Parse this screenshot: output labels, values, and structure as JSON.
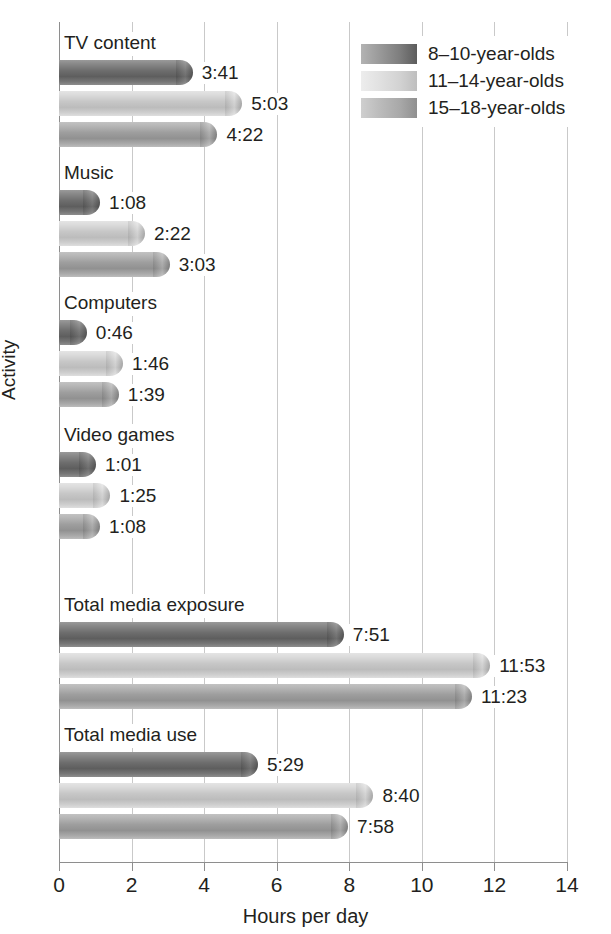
{
  "chart_data": {
    "type": "bar",
    "orientation": "horizontal",
    "title": "",
    "xlabel": "Hours per day",
    "ylabel": "Activity",
    "xlim": [
      0,
      14
    ],
    "xticks": [
      0,
      2,
      4,
      6,
      8,
      10,
      12,
      14
    ],
    "xticklabels": [
      "0",
      "2",
      "4",
      "6",
      "8",
      "10",
      "12",
      "14"
    ],
    "grid": true,
    "legend_position": "top-right",
    "categories": [
      "TV content",
      "Music",
      "Computers",
      "Video games",
      "Total media exposure",
      "Total media use"
    ],
    "series": [
      {
        "name": "8–10-year-olds",
        "color": "#6e6e6e",
        "labels": [
          "3:41",
          "1:08",
          "0:46",
          "1:01",
          "7:51",
          "5:29"
        ],
        "values": [
          3.683,
          1.133,
          0.767,
          1.017,
          7.85,
          5.483
        ]
      },
      {
        "name": "11–14-year-olds",
        "color": "#c7c7c7",
        "labels": [
          "5:03",
          "2:22",
          "1:46",
          "1:25",
          "11:53",
          "8:40"
        ],
        "values": [
          5.05,
          2.367,
          1.767,
          1.417,
          11.883,
          8.667
        ]
      },
      {
        "name": "15–18-year-olds",
        "color": "#9e9e9e",
        "labels": [
          "4:22",
          "3:03",
          "1:39",
          "1:08",
          "11:23",
          "7:58"
        ],
        "values": [
          4.367,
          3.05,
          1.65,
          1.133,
          11.383,
          7.967
        ]
      }
    ]
  },
  "legend": {
    "items": [
      {
        "label": "8–10-year-olds"
      },
      {
        "label": "11–14-year-olds"
      },
      {
        "label": "15–18-year-olds"
      }
    ]
  },
  "axes": {
    "x_label": "Hours per day",
    "y_label": "Activity"
  }
}
